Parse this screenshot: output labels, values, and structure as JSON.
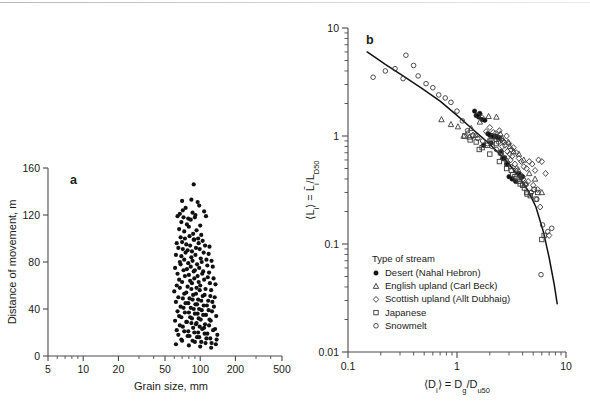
{
  "figure": {
    "panel_a_label": "a",
    "panel_b_label": "b"
  },
  "chart_data": [
    {
      "type": "scatter",
      "panel": "a",
      "title": "",
      "xlabel": "Grain size, mm",
      "ylabel": "Distance of movement, m",
      "xscale": "log",
      "yscale": "linear",
      "xlim": [
        5,
        500
      ],
      "ylim": [
        0,
        160
      ],
      "xticks": [
        5,
        10,
        20,
        50,
        100,
        200,
        500
      ],
      "xticklabels": [
        "5",
        "10",
        "20",
        "50",
        "100",
        "200",
        "500"
      ],
      "yticks": [
        0,
        40,
        80,
        120,
        160
      ],
      "yticklabels": [
        "0",
        "40",
        "80",
        "120",
        "160"
      ],
      "grid": false,
      "legend": "none",
      "marker": "filled-circle",
      "series": [
        {
          "name": "Grain displacement",
          "x": [
            88,
            70,
            84,
            95,
            67,
            71,
            75,
            98,
            108,
            64,
            72,
            79,
            86,
            91,
            69,
            77,
            83,
            90,
            100,
            112,
            66,
            73,
            80,
            87,
            93,
            102,
            68,
            74,
            81,
            88,
            96,
            105,
            63,
            70,
            76,
            82,
            89,
            97,
            110,
            120,
            65,
            71,
            78,
            85,
            92,
            99,
            107,
            118,
            62,
            69,
            75,
            84,
            91,
            101,
            113,
            125,
            67,
            73,
            79,
            86,
            94,
            103,
            115,
            128,
            61,
            68,
            77,
            83,
            90,
            98,
            106,
            119,
            64,
            72,
            80,
            88,
            95,
            104,
            116,
            130,
            66,
            74,
            82,
            89,
            97,
            108,
            121,
            135,
            63,
            70,
            78,
            85,
            93,
            100,
            111,
            124,
            60,
            67,
            76,
            84,
            92,
            99,
            109,
            122,
            65,
            73,
            81,
            87,
            96,
            105,
            117,
            133,
            62,
            71,
            79,
            86,
            94,
            102,
            114,
            127,
            68,
            75,
            83,
            91,
            98,
            107,
            118,
            131,
            64,
            72,
            80,
            88,
            95,
            103,
            112,
            126,
            66,
            74,
            82,
            90,
            97,
            106,
            120,
            137,
            61,
            69,
            77,
            85,
            93,
            101,
            110,
            123,
            67,
            76,
            84,
            92,
            99,
            108,
            119,
            134,
            63,
            71,
            79,
            87,
            96,
            104,
            115,
            129,
            65,
            73,
            81,
            89,
            98,
            109,
            122,
            140,
            69,
            78,
            86,
            94,
            102,
            113,
            125,
            138,
            62,
            70,
            80,
            90,
            100,
            111,
            124,
            136
          ],
          "y": [
            146,
            132,
            133,
            131,
            121,
            124,
            126,
            128,
            123,
            119,
            118,
            117,
            122,
            120,
            114,
            112,
            116,
            118,
            111,
            119,
            108,
            106,
            110,
            104,
            107,
            103,
            101,
            100,
            102,
            99,
            100,
            98,
            96,
            97,
            95,
            94,
            99,
            96,
            94,
            93,
            92,
            91,
            90,
            89,
            92,
            91,
            88,
            87,
            86,
            85,
            88,
            84,
            86,
            83,
            82,
            81,
            80,
            82,
            79,
            81,
            78,
            80,
            77,
            76,
            75,
            78,
            74,
            76,
            73,
            75,
            72,
            71,
            70,
            73,
            69,
            72,
            68,
            70,
            67,
            66,
            65,
            68,
            64,
            66,
            63,
            65,
            62,
            61,
            60,
            63,
            59,
            62,
            58,
            60,
            57,
            56,
            55,
            58,
            54,
            57,
            53,
            56,
            52,
            51,
            50,
            53,
            49,
            52,
            48,
            51,
            47,
            50,
            46,
            49,
            45,
            48,
            44,
            47,
            43,
            46,
            42,
            45,
            41,
            44,
            40,
            43,
            39,
            42,
            38,
            41,
            37,
            40,
            36,
            39,
            35,
            38,
            34,
            37,
            33,
            36,
            32,
            35,
            31,
            34,
            30,
            33,
            29,
            32,
            28,
            31,
            27,
            30,
            26,
            29,
            28,
            27,
            25,
            24,
            26,
            23,
            22,
            25,
            21,
            24,
            20,
            23,
            19,
            22,
            18,
            21,
            17,
            20,
            16,
            19,
            15,
            18,
            14,
            17,
            13,
            16,
            12,
            15,
            11,
            14,
            10,
            13,
            9,
            12,
            8,
            11,
            7,
            10,
            6,
            9,
            5,
            8,
            4,
            7,
            3,
            6,
            2,
            5,
            1,
            4,
            2,
            3,
            1,
            2
          ]
        }
      ]
    },
    {
      "type": "scatter",
      "panel": "b",
      "title": "",
      "xlabel": "⟨Dᵢ⟩ = D₉/Dᵤ₅₀",
      "xlabel_parts": {
        "lead": "⟨D",
        "lead_sub": "i",
        "mid": "⟩ = D",
        "mid_sub": "g",
        "tail": "/D",
        "tail_sub": "u50"
      },
      "ylabel_parts": {
        "lead": "⟨L",
        "lead_sub": "i",
        "mid": "⟩ = L̄",
        "mid_sub": "i",
        "tail": "/L",
        "tail_sub": "D50"
      },
      "xscale": "log",
      "yscale": "log",
      "xlim": [
        0.1,
        10
      ],
      "ylim": [
        0.01,
        10
      ],
      "xticks": [
        0.1,
        1,
        10
      ],
      "xticklabels": [
        "0.1",
        "1",
        "10"
      ],
      "yticks": [
        0.01,
        0.1,
        1,
        10
      ],
      "yticklabels": [
        "0.01",
        "0.1",
        "1",
        "10"
      ],
      "grid": false,
      "legend_position": "lower-left-inside",
      "legend_title": "Type of stream",
      "fit_curve": {
        "name": "fitted trend",
        "x": [
          0.15,
          0.22,
          0.32,
          0.48,
          0.7,
          1.0,
          1.4,
          1.9,
          2.4,
          3.0,
          3.7,
          4.5,
          5.3,
          6.2,
          7.0,
          7.8,
          8.3
        ],
        "y": [
          6.0,
          4.6,
          3.6,
          2.75,
          2.1,
          1.55,
          1.15,
          0.88,
          0.7,
          0.55,
          0.42,
          0.31,
          0.22,
          0.13,
          0.075,
          0.042,
          0.028
        ]
      },
      "series": [
        {
          "name": "Desert (Nahal Hebron)",
          "marker": "filled-circle",
          "x": [
            1.45,
            1.5,
            1.58,
            1.62,
            1.7,
            1.8,
            1.92,
            2.0,
            2.1,
            2.18,
            2.25,
            2.35,
            2.45,
            2.55,
            2.62,
            2.72,
            2.85,
            3.0,
            3.2,
            3.45,
            3.7,
            4.0,
            1.75,
            2.05
          ],
          "y": [
            1.7,
            1.55,
            1.5,
            1.62,
            1.42,
            1.4,
            1.05,
            1.02,
            1.0,
            0.99,
            1.0,
            0.98,
            0.96,
            0.72,
            0.62,
            0.63,
            0.55,
            0.42,
            0.4,
            0.38,
            0.45,
            0.42,
            0.82,
            0.86
          ]
        },
        {
          "name": "English upland (Carl Beck)",
          "marker": "open-triangle",
          "x": [
            0.72,
            0.88,
            1.02,
            1.15,
            1.3,
            1.48,
            1.62,
            1.95,
            2.3,
            2.6,
            2.95,
            3.3,
            3.7,
            4.1,
            4.6,
            5.2,
            2.5,
            3.05,
            6.0,
            1.35
          ],
          "y": [
            1.42,
            1.28,
            1.22,
            1.0,
            0.98,
            1.02,
            1.35,
            1.52,
            1.5,
            0.95,
            0.88,
            0.72,
            0.68,
            0.6,
            0.45,
            0.4,
            1.05,
            0.8,
            0.3,
            1.18
          ]
        },
        {
          "name": "Scottish upland (Allt Dubhaig)",
          "marker": "open-diamond",
          "x": [
            1.25,
            1.4,
            1.55,
            1.7,
            1.85,
            2.0,
            2.12,
            2.25,
            2.4,
            2.55,
            2.7,
            2.85,
            3.0,
            3.15,
            3.3,
            3.5,
            3.7,
            3.9,
            4.1,
            4.35,
            4.6,
            4.9,
            5.2,
            5.6,
            6.0,
            6.5,
            2.05,
            2.3,
            2.6,
            2.9,
            3.2,
            3.6,
            4.0,
            4.5,
            5.0,
            5.5,
            2.45,
            2.75,
            3.05,
            3.4,
            3.8,
            4.25,
            4.8,
            5.8,
            7.0,
            2.15,
            2.65,
            3.1,
            3.55,
            4.05
          ],
          "y": [
            1.05,
            1.02,
            1.55,
            1.48,
            1.1,
            1.2,
            1.0,
            1.05,
            0.95,
            0.92,
            0.88,
            1.0,
            0.85,
            0.75,
            0.78,
            0.7,
            0.62,
            0.58,
            0.52,
            0.5,
            0.58,
            0.55,
            0.48,
            0.6,
            0.58,
            0.45,
            0.92,
            0.98,
            0.8,
            0.72,
            0.65,
            0.48,
            0.42,
            0.38,
            0.35,
            0.32,
            1.12,
            0.82,
            0.68,
            0.55,
            0.44,
            0.35,
            0.3,
            0.22,
            0.12,
            1.08,
            0.9,
            0.6,
            0.5,
            0.4
          ]
        },
        {
          "name": "Japanese",
          "marker": "open-square",
          "x": [
            1.18,
            1.32,
            1.5,
            1.7,
            1.9,
            2.1,
            2.3,
            2.5,
            2.7,
            2.9,
            3.15,
            3.4,
            3.7,
            4.0,
            4.35,
            4.7,
            5.1,
            5.5,
            6.0,
            1.6,
            2.0,
            2.45,
            2.85,
            3.25,
            3.8,
            4.4,
            5.3,
            6.3,
            4.15,
            3.55
          ],
          "y": [
            1.0,
            0.92,
            0.88,
            0.78,
            0.82,
            0.9,
            0.85,
            0.7,
            0.62,
            0.55,
            0.48,
            0.42,
            0.38,
            0.35,
            0.3,
            0.28,
            0.32,
            0.3,
            0.11,
            0.75,
            0.68,
            0.58,
            0.5,
            0.44,
            0.36,
            0.29,
            0.26,
            0.12,
            0.33,
            0.4
          ]
        },
        {
          "name": "Snowmelt",
          "marker": "open-circle",
          "x": [
            0.17,
            0.22,
            0.27,
            0.32,
            0.34,
            0.4,
            0.44,
            0.52,
            0.6,
            0.68,
            0.78,
            0.88,
            1.0,
            1.12,
            1.25,
            1.4,
            1.55,
            1.72,
            1.9,
            2.1,
            2.3,
            2.55,
            2.8,
            3.1,
            3.45,
            3.85,
            4.3,
            4.8,
            5.4,
            6.1,
            6.8,
            5.9,
            7.4,
            2.0,
            2.4
          ],
          "y": [
            3.5,
            4.0,
            4.2,
            3.4,
            5.6,
            4.5,
            3.6,
            3.05,
            2.8,
            2.4,
            2.25,
            2.05,
            1.7,
            1.38,
            1.12,
            1.0,
            0.95,
            0.9,
            0.85,
            0.8,
            0.75,
            0.68,
            0.6,
            0.52,
            0.48,
            0.42,
            0.36,
            0.3,
            0.26,
            0.15,
            0.13,
            0.052,
            0.14,
            0.92,
            0.88
          ]
        }
      ]
    }
  ],
  "panel_b_legend": {
    "title": "Type of stream",
    "items": [
      {
        "marker": "filled-circle",
        "label": "Desert (Nahal Hebron)"
      },
      {
        "marker": "open-triangle",
        "label": "English upland (Carl Beck)"
      },
      {
        "marker": "open-diamond",
        "label": "Scottish upland (Allt Dubhaig)"
      },
      {
        "marker": "open-square",
        "label": "Japanese"
      },
      {
        "marker": "open-circle",
        "label": "Snowmelt"
      }
    ]
  },
  "colors": {
    "ink": "#111111",
    "axis": "#4a4a4a",
    "background": "#ffffff"
  }
}
